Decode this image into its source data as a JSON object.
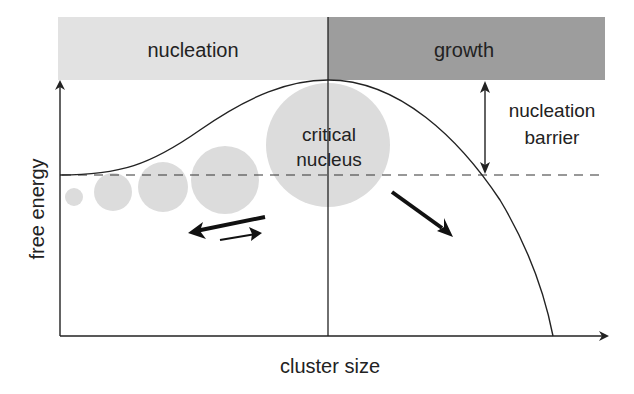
{
  "diagram": {
    "type": "free-energy-barrier",
    "regions": [
      {
        "label": "nucleation",
        "color": "#e2e2e2"
      },
      {
        "label": "growth",
        "color": "#9d9d9d"
      }
    ],
    "axes": {
      "xlabel": "cluster size",
      "ylabel": "free energy"
    },
    "annotations": {
      "critical_nucleus_line1": "critical",
      "critical_nucleus_line2": "nucleus",
      "barrier_line1": "nucleation",
      "barrier_line2": "barrier"
    },
    "colors": {
      "cluster_fill": "#dcdcdc",
      "line": "#222222"
    }
  }
}
